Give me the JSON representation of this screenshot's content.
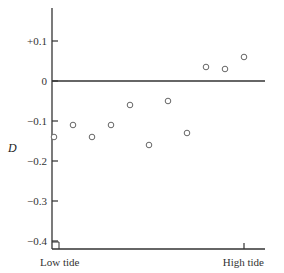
{
  "chart_data": {
    "type": "scatter",
    "title": "",
    "xlabel": "",
    "ylabel": "D",
    "x_tick_labels": [
      "Low tide",
      "High tide"
    ],
    "y_ticks": [
      0.1,
      0,
      -0.1,
      -0.2,
      -0.3,
      -0.4
    ],
    "y_tick_labels": [
      "+0.1",
      "0",
      "−0.1",
      "−0.2",
      "−0.3",
      "−0.4"
    ],
    "ylim": [
      -0.42,
      0.2
    ],
    "xlim": [
      0,
      1.1
    ],
    "grid": false,
    "legend": null,
    "reference_line": {
      "y": 0
    },
    "marker": "open-circle",
    "series": [
      {
        "name": "D",
        "x": [
          0.0,
          0.1,
          0.2,
          0.3,
          0.4,
          0.5,
          0.6,
          0.7,
          0.8,
          0.9,
          1.0
        ],
        "y": [
          -0.14,
          -0.11,
          -0.14,
          -0.11,
          -0.06,
          -0.16,
          -0.05,
          -0.13,
          0.035,
          0.03,
          0.06
        ]
      }
    ]
  },
  "colors": {
    "axis": "#333333",
    "marker": "#666666",
    "text": "#333333"
  }
}
